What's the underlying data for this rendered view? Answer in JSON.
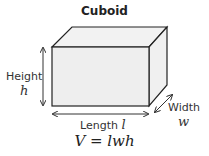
{
  "title": "Cuboid",
  "labels": {
    "height": "Height",
    "height_var": "h",
    "length": "Length",
    "length_var": "l",
    "width": "Width",
    "width_var": "w"
  },
  "formula": "V = lwh",
  "colors": {
    "face": "#eeeeee",
    "edge": "#222222"
  }
}
